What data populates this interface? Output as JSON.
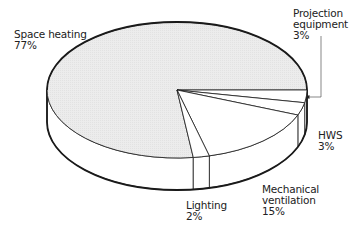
{
  "chart_data": {
    "type": "pie",
    "style": "3d-exploded-none",
    "title": "",
    "slices": [
      {
        "label": "Space heating",
        "value": 77,
        "display": "77%",
        "fill": "#ebebeb"
      },
      {
        "label": "Projection equipment",
        "value": 3,
        "display": "3%",
        "fill": "#ffffff"
      },
      {
        "label": "HWS",
        "value": 3,
        "display": "3%",
        "fill": "#ffffff"
      },
      {
        "label": "Mechanical ventilation",
        "value": 15,
        "display": "15%",
        "fill": "#ffffff"
      },
      {
        "label": "Lighting",
        "value": 2,
        "display": "2%",
        "fill": "#ffffff"
      }
    ],
    "units": "%",
    "legend": "none (direct labels)"
  },
  "labels": {
    "space_heating": {
      "name": "Space heating",
      "pct": "77%"
    },
    "projection": {
      "line1": "Projection",
      "line2": "equipment",
      "pct": "3%"
    },
    "hws": {
      "name": "HWS",
      "pct": "3%"
    },
    "mech_vent": {
      "line1": "Mechanical",
      "line2": "ventilation",
      "pct": "15%"
    },
    "lighting": {
      "name": "Lighting",
      "pct": "2%"
    }
  },
  "colors": {
    "space_heating_fill": "#ebebeb",
    "other_fill": "#ffffff",
    "stroke": "#1a1a1a"
  }
}
